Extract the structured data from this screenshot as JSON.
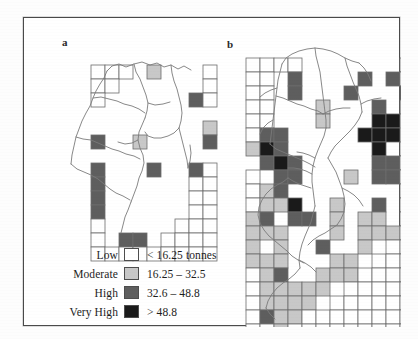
{
  "figure": {
    "panels": [
      {
        "id": "a",
        "label": "a"
      },
      {
        "id": "b",
        "label": "b"
      }
    ]
  },
  "legend": {
    "rows": [
      {
        "label": "Low",
        "range": "< 16.25 tonnes",
        "color": "#ffffff"
      },
      {
        "label": "Moderate",
        "range": "16.25 – 32.5",
        "color": "#c8c8c8"
      },
      {
        "label": "High",
        "range": "32.6 – 48.8",
        "color": "#5e5e5e"
      },
      {
        "label": "Very High",
        "range": "> 48.8",
        "color": "#1a1a1a"
      }
    ]
  },
  "chart_data": {
    "type": "heatmap",
    "title": "",
    "xlabel": "",
    "ylabel": "",
    "classes": [
      {
        "name": "Low",
        "range": "< 16.25 tonnes",
        "min": 0,
        "max": 16.25,
        "color": "#ffffff"
      },
      {
        "name": "Moderate",
        "range": "16.25 – 32.5",
        "min": 16.25,
        "max": 32.5,
        "color": "#c8c8c8"
      },
      {
        "name": "High",
        "range": "32.6 – 48.8",
        "min": 32.6,
        "max": 48.8,
        "color": "#5e5e5e"
      },
      {
        "name": "Very High",
        "range": "> 48.8",
        "min": 48.8,
        "max": null,
        "color": "#1a1a1a"
      }
    ],
    "units": "tonnes",
    "cell_size_px": 14,
    "panels": [
      {
        "id": "a",
        "origin": [
          67,
          47
        ],
        "cols": 9,
        "rows": 14,
        "grid": [
          [
            0,
            0,
            0,
            9,
            1,
            9,
            9,
            9,
            0
          ],
          [
            0,
            0,
            9,
            9,
            9,
            9,
            9,
            9,
            0
          ],
          [
            0,
            9,
            9,
            9,
            9,
            9,
            9,
            2,
            0
          ],
          [
            9,
            9,
            9,
            9,
            9,
            9,
            9,
            9,
            9
          ],
          [
            9,
            9,
            9,
            9,
            9,
            9,
            9,
            9,
            1
          ],
          [
            2,
            9,
            9,
            1,
            9,
            9,
            9,
            9,
            2
          ],
          [
            9,
            9,
            9,
            9,
            9,
            9,
            9,
            9,
            9
          ],
          [
            2,
            9,
            9,
            9,
            2,
            9,
            9,
            2,
            0
          ],
          [
            2,
            9,
            9,
            9,
            9,
            9,
            9,
            0,
            0
          ],
          [
            2,
            9,
            9,
            9,
            9,
            9,
            9,
            0,
            0
          ],
          [
            2,
            9,
            9,
            9,
            9,
            9,
            9,
            0,
            0
          ],
          [
            0,
            9,
            9,
            9,
            9,
            9,
            0,
            0,
            0
          ],
          [
            0,
            9,
            2,
            2,
            9,
            0,
            0,
            0,
            0
          ],
          [
            0,
            0,
            0,
            0,
            0,
            0,
            0,
            0,
            0
          ]
        ]
      },
      {
        "id": "b",
        "origin": [
          222,
          40
        ],
        "cols": 12,
        "rows": 20,
        "grid": [
          [
            0,
            0,
            0,
            0,
            9,
            9,
            9,
            9,
            9,
            9,
            9,
            0
          ],
          [
            0,
            0,
            9,
            2,
            9,
            9,
            9,
            9,
            2,
            9,
            2,
            0
          ],
          [
            0,
            0,
            9,
            2,
            9,
            9,
            9,
            2,
            9,
            9,
            9,
            2
          ],
          [
            0,
            0,
            9,
            9,
            9,
            1,
            9,
            9,
            9,
            2,
            9,
            1
          ],
          [
            0,
            0,
            9,
            9,
            9,
            1,
            9,
            9,
            9,
            3,
            3,
            9
          ],
          [
            0,
            2,
            2,
            9,
            9,
            9,
            9,
            9,
            3,
            3,
            3,
            9
          ],
          [
            1,
            3,
            2,
            9,
            9,
            9,
            9,
            9,
            9,
            3,
            9,
            0
          ],
          [
            9,
            2,
            3,
            2,
            9,
            9,
            9,
            9,
            9,
            2,
            2,
            0
          ],
          [
            0,
            9,
            2,
            2,
            9,
            9,
            9,
            1,
            9,
            2,
            2,
            0
          ],
          [
            0,
            1,
            2,
            9,
            9,
            9,
            9,
            9,
            9,
            9,
            9,
            0
          ],
          [
            0,
            1,
            1,
            3,
            9,
            9,
            1,
            9,
            9,
            2,
            9,
            0
          ],
          [
            1,
            2,
            9,
            2,
            2,
            9,
            1,
            9,
            1,
            1,
            9,
            0
          ],
          [
            1,
            1,
            1,
            9,
            9,
            9,
            1,
            9,
            1,
            1,
            1,
            0
          ],
          [
            1,
            9,
            1,
            9,
            9,
            2,
            9,
            9,
            1,
            9,
            0,
            0
          ],
          [
            1,
            1,
            1,
            9,
            9,
            9,
            1,
            1,
            9,
            0,
            0,
            0
          ],
          [
            0,
            1,
            2,
            9,
            9,
            1,
            1,
            1,
            0,
            0,
            0,
            0
          ],
          [
            0,
            1,
            1,
            1,
            1,
            1,
            9,
            0,
            0,
            0,
            0,
            0
          ],
          [
            0,
            1,
            1,
            1,
            1,
            9,
            0,
            0,
            0,
            0,
            0,
            0
          ],
          [
            0,
            2,
            1,
            1,
            0,
            0,
            0,
            0,
            0,
            0,
            0,
            0
          ],
          [
            0,
            0,
            1,
            0,
            0,
            0,
            0,
            0,
            0,
            0,
            0,
            0
          ]
        ]
      }
    ]
  }
}
